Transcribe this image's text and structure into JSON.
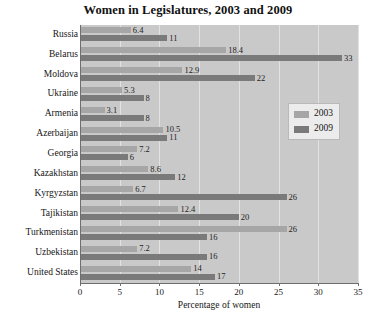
{
  "chart_data": {
    "type": "bar",
    "orientation": "horizontal",
    "title": "Women in Legislatures, 2003 and 2009",
    "xlabel": "Percentage of women",
    "ylabel": "",
    "xlim": [
      0,
      35
    ],
    "xticks": [
      "0",
      "5",
      "10",
      "15",
      "20",
      "25",
      "30",
      "35"
    ],
    "grid": true,
    "legend_position": "right-middle",
    "categories": [
      "Russia",
      "Belarus",
      "Moldova",
      "Ukraine",
      "Armenia",
      "Azerbaijan",
      "Georgia",
      "Kazakhstan",
      "Kyrgyzstan",
      "Tajikistan",
      "Turkmenistan",
      "Uzbekistan",
      "United States"
    ],
    "series": [
      {
        "name": "2003",
        "color": "#a6a6a6",
        "values": [
          6.4,
          18.4,
          12.9,
          5.3,
          3.1,
          10.5,
          7.2,
          8.6,
          6.7,
          12.4,
          26,
          7.2,
          14
        ],
        "labels": [
          "6.4",
          "18.4",
          "12.9",
          "5.3",
          "3.1",
          "10.5",
          "7.2",
          "8.6",
          "6.7",
          "12.4",
          "26",
          "7.2",
          "14"
        ]
      },
      {
        "name": "2009",
        "color": "#7a7a7a",
        "values": [
          11,
          33,
          22,
          8,
          8,
          11,
          6,
          12,
          26,
          20,
          16,
          16,
          17
        ],
        "labels": [
          "11",
          "33",
          "22",
          "8",
          "8",
          "11",
          "6",
          "12",
          "26",
          "20",
          "16",
          "16",
          "17"
        ]
      }
    ]
  },
  "legend": {
    "items": [
      {
        "label": "2003",
        "color": "#a6a6a6"
      },
      {
        "label": "2009",
        "color": "#7a7a7a"
      }
    ]
  },
  "colors": {
    "plot_background": "#c9c9c9",
    "gridline": "#e2e2e2",
    "axis": "#6e6e6e",
    "series_2003": "#a6a6a6",
    "series_2009": "#7a7a7a",
    "legend_background": "#ececec"
  }
}
